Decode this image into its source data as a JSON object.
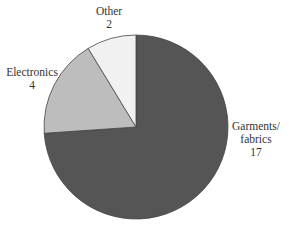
{
  "chart_data": {
    "type": "pie",
    "title": "",
    "categories": [
      "Garments/fabrics",
      "Electronics",
      "Other"
    ],
    "values": [
      17,
      4,
      2
    ],
    "colors": [
      "#555555",
      "#bdbdbd",
      "#f1f1f1"
    ],
    "start_angle_deg": 90,
    "direction": "clockwise",
    "labels": [
      {
        "name_lines": [
          "Garments/",
          "fabrics"
        ],
        "value": "17"
      },
      {
        "name_lines": [
          "Electronics"
        ],
        "value": "4"
      },
      {
        "name_lines": [
          "Other"
        ],
        "value": "2"
      }
    ]
  }
}
